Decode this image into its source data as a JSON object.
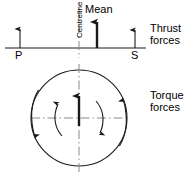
{
  "diagram": {
    "colors": {
      "stroke": "#1a1a1a",
      "centreline": "#6e6e6e",
      "background": "#ffffff"
    },
    "thrust_section": {
      "label_line1": "Thrust",
      "label_line2": "forces",
      "baseline_label": "baseline",
      "centreline_label": "Centreline",
      "mean_label": "Mean",
      "port_label": "P",
      "starboard_label": "S",
      "arrows": [
        {
          "name": "port-thrust-arrow",
          "label": "P",
          "x": 20,
          "length": 18,
          "weight": "thin",
          "direction": "up"
        },
        {
          "name": "mean-thrust-arrow",
          "label": "Mean",
          "x": 97,
          "length": 26,
          "weight": "thick",
          "direction": "up"
        },
        {
          "name": "starboard-thrust-arrow",
          "label": "S",
          "x": 135,
          "length": 18,
          "weight": "thin",
          "direction": "up"
        }
      ]
    },
    "torque_section": {
      "label_line1": "Torque",
      "label_line2": "forces",
      "circle": {
        "cx": 79,
        "cy": 118,
        "r": 48
      },
      "arrows": [
        {
          "name": "centre-torque-arrow",
          "direction": "up",
          "weight": "thick"
        },
        {
          "name": "left-tangential-arrow",
          "direction": "down",
          "weight": "thin"
        },
        {
          "name": "right-tangential-arrow",
          "direction": "up",
          "weight": "thin"
        },
        {
          "name": "inner-left-curved-arrow",
          "direction": "up",
          "weight": "thin"
        },
        {
          "name": "inner-right-curved-arrow",
          "direction": "down",
          "weight": "thin"
        }
      ]
    }
  }
}
